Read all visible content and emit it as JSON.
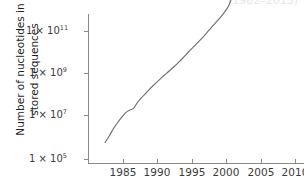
{
  "figure": {
    "title_partial": "(1982–2013)",
    "background_color": "#ffffff",
    "line_color": "#6f6f6f",
    "axis_color": "#8a8a8a",
    "text_color": "#1f1f1f"
  },
  "axes": {
    "y_title_line1": "Number of nucleotides in",
    "y_title_line2": "stored sequences",
    "y_ticks": [
      {
        "label_mantissa": "1 × 10",
        "label_exponent": "11",
        "value": 100000000000.0
      },
      {
        "label_mantissa": "1 × 10",
        "label_exponent": "9",
        "value": 1000000000.0
      },
      {
        "label_mantissa": "1 × 10",
        "label_exponent": "7",
        "value": 10000000.0
      },
      {
        "label_mantissa": "1 × 10",
        "label_exponent": "5",
        "value": 100000.0
      }
    ],
    "x_ticks": [
      {
        "label": "1985",
        "value": 1985
      },
      {
        "label": "1990",
        "value": 1990
      },
      {
        "label": "1995",
        "value": 1995
      },
      {
        "label": "2000",
        "value": 2000
      },
      {
        "label": "2005",
        "value": 2005
      },
      {
        "label": "2010",
        "value": 2010
      }
    ]
  },
  "chart_data": {
    "type": "line",
    "title": "",
    "xlabel": "",
    "ylabel": "Number of nucleotides in stored sequences",
    "yscale": "log",
    "xlim": [
      1982.2,
      2013.4
    ],
    "ylim": [
      100000.0,
      1000000000000.0
    ],
    "grid": false,
    "legend": false,
    "series": [
      {
        "name": "Nucleotides in stored sequences",
        "x": [
          1982.4,
          1983.0,
          1983.6,
          1984.2,
          1984.8,
          1985.4,
          1986.0,
          1986.5,
          1987.0,
          1987.6,
          1988.2,
          1988.8,
          1989.4,
          1990.0,
          1990.6,
          1991.2,
          1991.8,
          1992.4,
          1993.0,
          1993.6,
          1994.2,
          1994.8,
          1995.4,
          1996.0,
          1996.6,
          1997.2,
          1997.8,
          1998.4,
          1999.0,
          1999.6,
          2000.0,
          2000.4,
          2000.8,
          2001.2,
          2001.8,
          2002.4,
          2003.0,
          2003.6,
          2004.2,
          2004.6,
          2005.0,
          2005.6,
          2006.2,
          2006.8,
          2007.4,
          2008.0,
          2008.6,
          2009.2,
          2009.8,
          2010.4,
          2011.0,
          2011.6,
          2012.2,
          2012.8,
          2013.2
        ],
        "y": [
          600000.0,
          1200000.0,
          2600000.0,
          5000000.0,
          9000000.0,
          15000000.0,
          20000000.0,
          23000000.0,
          40000000.0,
          70000000.0,
          110000000.0,
          180000000.0,
          280000000.0,
          420000000.0,
          650000000.0,
          950000000.0,
          1400000000.0,
          2100000000.0,
          3200000000.0,
          5000000000.0,
          8000000000.0,
          13000000000.0,
          20000000000.0,
          32000000000.0,
          50000000000.0,
          85000000000.0,
          140000000000.0,
          230000000000.0,
          380000000000.0,
          650000000000.0,
          1000000000000.0,
          1600000000000.0,
          3500000000000.0,
          6000000000000.0,
          8000000000000.0,
          10000000000000.0,
          14000000000000.0,
          20000000000000.0,
          29000000000000.0,
          32000000000000.0,
          55000000000000.0,
          70000000000000.0,
          85000000000000.0,
          100000000000000.0,
          120000000000000.0,
          150000000000000.0,
          180000000000000.0,
          210000000000000.0,
          240000000000000.0,
          280000000000000.0,
          320000000000000.0,
          370000000000000.0,
          420000000000000.0,
          490000000000000.0,
          560000000000000.0
        ],
        "color": "#6f6f6f"
      }
    ],
    "annotations": []
  },
  "geometry": {
    "plot_left_px": 88,
    "plot_right_px": 304,
    "plot_top_px": 14,
    "plot_bottom_px": 163,
    "x_tick_px": [
      123,
      157,
      192,
      226,
      261,
      295
    ],
    "y_tick_px": [
      31,
      73,
      115,
      159
    ]
  }
}
